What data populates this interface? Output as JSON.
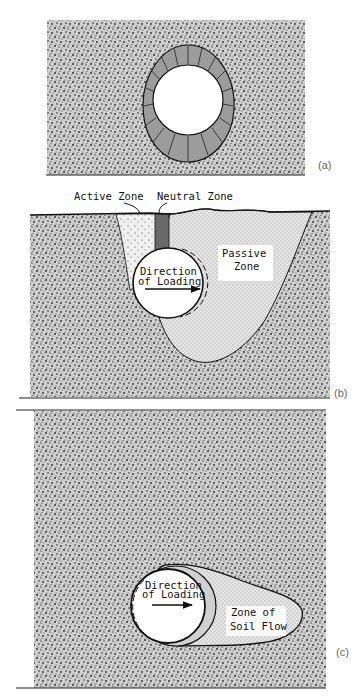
{
  "figure": {
    "panels": [
      {
        "id": "a",
        "tag": "(a)",
        "description": "Pipe in soil with uniform radial pressure ring"
      },
      {
        "id": "b",
        "tag": "(b)",
        "labels": {
          "active_zone": "Active Zone",
          "neutral_zone": "Neutral Zone",
          "passive_zone_line1": "Passive",
          "passive_zone_line2": "Zone",
          "direction_line1": "Direction",
          "direction_line2": "of Loading"
        }
      },
      {
        "id": "c",
        "tag": "(c)",
        "labels": {
          "direction_line1": "Direction",
          "direction_line2": "of Loading",
          "flow_zone_line1": "Zone of",
          "flow_zone_line2": "Soil Flow"
        }
      }
    ],
    "colors": {
      "soil": "#b8b8b8",
      "soil_dark": "#3a3a3a",
      "passive_fill": "#d6d6d6",
      "active_fill": "#e6e6e6",
      "neutral_fill": "#6a6a6a",
      "ring_fill": "#9a9a9a",
      "line": "#111111",
      "background": "#ffffff"
    }
  }
}
